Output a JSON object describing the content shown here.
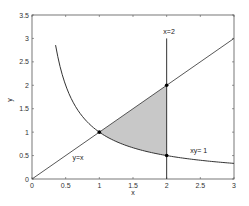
{
  "chart_data": {
    "type": "line",
    "title": "",
    "xlabel": "x",
    "ylabel": "y",
    "xlim": [
      0,
      3
    ],
    "ylim": [
      0,
      3.5
    ],
    "grid": false,
    "xticks": [
      "0",
      "0.5",
      "1",
      "1.5",
      "2",
      "2.5",
      "3"
    ],
    "yticks": [
      "0",
      "0.5",
      "1",
      "1.5",
      "2",
      "2.5",
      "3",
      "3.5"
    ],
    "series": [
      {
        "name": "y=x",
        "kind": "line",
        "x": [
          0,
          3
        ],
        "y": [
          0,
          3
        ]
      },
      {
        "name": "xy= 1",
        "kind": "curve",
        "x_range": [
          0.35,
          3
        ],
        "equation": "y = 1/x"
      },
      {
        "name": "x=2",
        "kind": "vertical",
        "x": 2,
        "y_range": [
          0,
          3
        ]
      }
    ],
    "shaded_region": {
      "between": [
        "y=x",
        "xy= 1"
      ],
      "x_range": [
        1,
        2
      ],
      "color": "#c8c8c8"
    },
    "points": [
      {
        "x": 1,
        "y": 1
      },
      {
        "x": 2,
        "y": 2
      },
      {
        "x": 2,
        "y": 0.5
      }
    ],
    "annotations": [
      {
        "text": "y=x",
        "x": 0.6,
        "y": 0.4
      },
      {
        "text": "x=2",
        "x": 1.95,
        "y": 3.1
      },
      {
        "text": "xy= 1",
        "x": 2.35,
        "y": 0.55
      }
    ]
  }
}
